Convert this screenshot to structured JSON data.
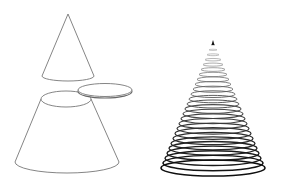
{
  "figure": {
    "colors": {
      "background": "#ffffff",
      "outline": "#777777",
      "rings_dark": "#111111",
      "rings_light": "#bbbbbb"
    },
    "left_group": {
      "top_cone": {
        "apex": [
          68,
          14
        ],
        "base_center": [
          68,
          76
        ],
        "rx": 26,
        "ry": 5
      },
      "disk": {
        "center": [
          105,
          90
        ],
        "rx": 27,
        "ry": 6.5,
        "thickness": 1.5
      },
      "frustum": {
        "top_center": [
          66,
          99
        ],
        "top_rx": 25,
        "top_ry": 8,
        "bottom_center": [
          67,
          162
        ],
        "bottom_rx": 52,
        "bottom_ry": 11
      }
    },
    "right_group": {
      "stacked_cone": {
        "apex": [
          213,
          40
        ],
        "base_center": [
          213,
          168
        ],
        "base_rx": 52,
        "base_ry": 8,
        "ring_count": 26
      }
    }
  }
}
